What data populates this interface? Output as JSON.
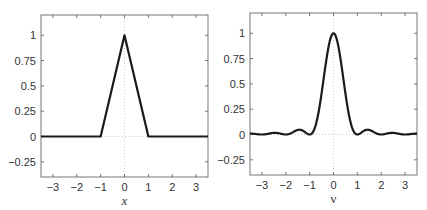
{
  "chart_data": [
    {
      "type": "line",
      "name": "triangle-function",
      "title": "",
      "xlabel": "x",
      "ylabel": "",
      "xlim": [
        -3.5,
        3.5
      ],
      "ylim": [
        -0.4,
        1.2
      ],
      "xticks": [
        -3,
        -2,
        -1,
        0,
        1,
        2,
        3
      ],
      "xtick_labels": [
        "−3",
        "−2",
        "−1",
        "0",
        "1",
        "2",
        "3"
      ],
      "yticks": [
        -0.25,
        0,
        0.25,
        0.5,
        0.75,
        1
      ],
      "ytick_labels": [
        "−0.25",
        "0",
        "0.25",
        "0.5",
        "0.75",
        "1"
      ],
      "grid": "dotted zero lines",
      "series": [
        {
          "name": "Lambda(x)",
          "x": [
            -3.5,
            -1,
            0,
            1,
            3.5
          ],
          "y": [
            0,
            0,
            1,
            0,
            0
          ]
        }
      ]
    },
    {
      "type": "line",
      "name": "sinc-squared",
      "title": "",
      "xlabel": "ν",
      "ylabel": "",
      "xlim": [
        -3.5,
        3.5
      ],
      "ylim": [
        -0.4,
        1.2
      ],
      "xticks": [
        -3,
        -2,
        -1,
        0,
        1,
        2,
        3
      ],
      "xtick_labels": [
        "−3",
        "−2",
        "−1",
        "0",
        "1",
        "2",
        "3"
      ],
      "yticks": [
        -0.25,
        0,
        0.25,
        0.5,
        0.75,
        1
      ],
      "ytick_labels": [
        "−0.25",
        "0",
        "0.25",
        "0.5",
        "0.75",
        "1"
      ],
      "grid": "dotted zero lines",
      "series": [
        {
          "name": "sinc^2(nu)",
          "x": [
            -3.5,
            -3,
            -2.46,
            -2,
            -1.43,
            -1,
            -0.75,
            -0.5,
            -0.25,
            0,
            0.25,
            0.5,
            0.75,
            1,
            1.43,
            2,
            2.46,
            3,
            3.5
          ],
          "y": [
            0.0083,
            0,
            0.0165,
            0,
            0.0472,
            0,
            0.1801,
            0.4053,
            0.8106,
            1,
            0.8106,
            0.4053,
            0.1801,
            0,
            0.0472,
            0,
            0.0165,
            0,
            0.0083
          ]
        }
      ]
    }
  ]
}
